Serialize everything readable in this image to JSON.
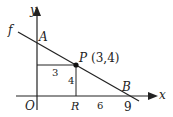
{
  "diagram": {
    "axes": {
      "x_label": "x",
      "y_label": "y",
      "origin_label": "O"
    },
    "line_label": "f",
    "points": {
      "A": {
        "label": "A"
      },
      "P": {
        "label": "P",
        "coords": "(3,4)"
      },
      "R": {
        "label": "R"
      },
      "B": {
        "label": "B"
      }
    },
    "segment_labels": {
      "horizontal_to_P": "3",
      "vertical_PR": "4",
      "RB": "6",
      "B_tick": "9"
    },
    "colors": {
      "stroke": "#222222",
      "background": "#ffffff"
    }
  }
}
